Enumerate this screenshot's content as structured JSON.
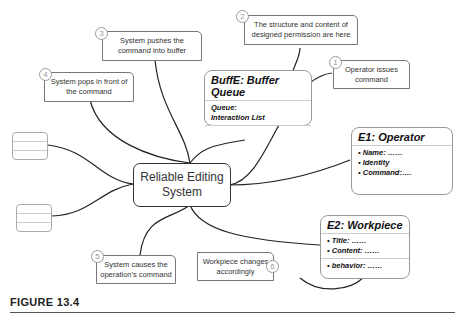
{
  "center": {
    "line1": "Reliable Editing",
    "line2": "System"
  },
  "callouts": [
    {
      "num": "1",
      "line1": "Operator issues",
      "line2": "command"
    },
    {
      "num": "2",
      "line1": "The structure and content of",
      "line2": "designed permission are here"
    },
    {
      "num": "3",
      "line1": "System pushes the",
      "line2": "command into buffer"
    },
    {
      "num": "4",
      "line1": "System pops in front of",
      "line2": "the command"
    },
    {
      "num": "5",
      "line1": "System causes the",
      "line2": "operation's command"
    },
    {
      "num": "6",
      "line1": "Workpiece changes",
      "line2": "accordingly"
    }
  ],
  "entities": {
    "buffer": {
      "title": "BuffE: Buffer Queue",
      "items": [
        "Queue:",
        "Interaction List"
      ]
    },
    "operator": {
      "title": "E1: Operator",
      "items": [
        "• Name: ……",
        "• Identity",
        "• Command:…."
      ]
    },
    "workpiece": {
      "title": "E2: Workpiece",
      "items": [
        "• Title: ……",
        "• Content: ……"
      ],
      "behavior": "• behavior: ……"
    }
  },
  "figure": {
    "caption": "FIGURE 13.4"
  }
}
